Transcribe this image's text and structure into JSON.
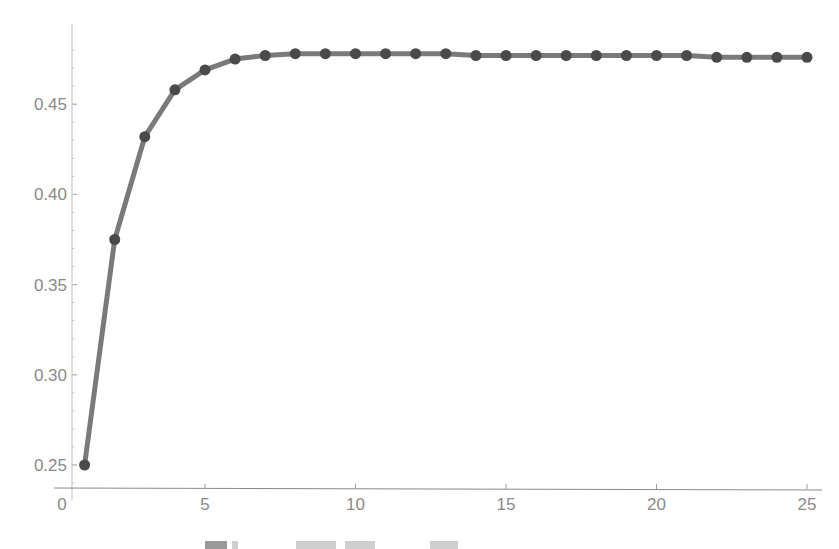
{
  "chart_data": {
    "type": "line",
    "title": "",
    "xlabel": "",
    "ylabel": "",
    "x": [
      1,
      2,
      3,
      4,
      5,
      6,
      7,
      8,
      9,
      10,
      11,
      12,
      13,
      14,
      15,
      16,
      17,
      18,
      19,
      20,
      21,
      22,
      23,
      24,
      25
    ],
    "series": [
      {
        "name": "series-1",
        "values": [
          0.25,
          0.375,
          0.432,
          0.458,
          0.469,
          0.475,
          0.477,
          0.478,
          0.478,
          0.478,
          0.478,
          0.478,
          0.478,
          0.477,
          0.477,
          0.477,
          0.477,
          0.477,
          0.477,
          0.477,
          0.477,
          0.476,
          0.476,
          0.476,
          0.476
        ],
        "color": "#7a7a7a",
        "marker_color": "#4a4a4a"
      }
    ],
    "x_ticks": [
      "0",
      "5",
      "10",
      "15",
      "20",
      "25"
    ],
    "y_ticks": [
      "0.25",
      "0.30",
      "0.35",
      "0.40",
      "0.45"
    ],
    "xlim": [
      0,
      25.5
    ],
    "ylim": [
      0.237,
      0.49
    ],
    "grid": false,
    "legend": "none",
    "markers": true
  },
  "axes": {
    "x_tick_labels": [
      "0",
      "5",
      "10",
      "15",
      "20",
      "25"
    ],
    "y_tick_labels": [
      "0.25",
      "0.30",
      "0.35",
      "0.40",
      "0.45"
    ]
  },
  "caption": {
    "note": "caption text cut off at bottom edge"
  }
}
